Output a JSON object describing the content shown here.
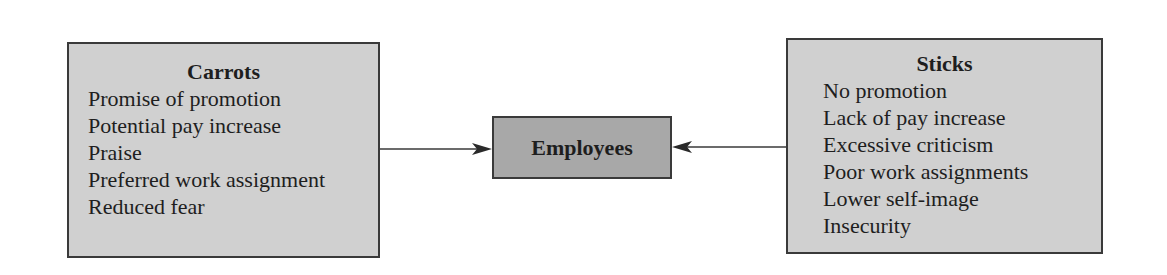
{
  "diagram": {
    "carrots": {
      "title": "Carrots",
      "items": [
        "Promise of promotion",
        "Potential pay increase",
        "Praise",
        "Preferred work assignment",
        "Reduced fear"
      ]
    },
    "center": {
      "label": "Employees"
    },
    "sticks": {
      "title": "Sticks",
      "items": [
        "No promotion",
        "Lack of pay increase",
        "Excessive criticism",
        "Poor work assignments",
        "Lower self-image",
        "Insecurity"
      ]
    },
    "colors": {
      "side_box_fill": "#d0d0d0",
      "center_box_fill": "#a8a8a8",
      "border": "#3a3a3a"
    }
  }
}
